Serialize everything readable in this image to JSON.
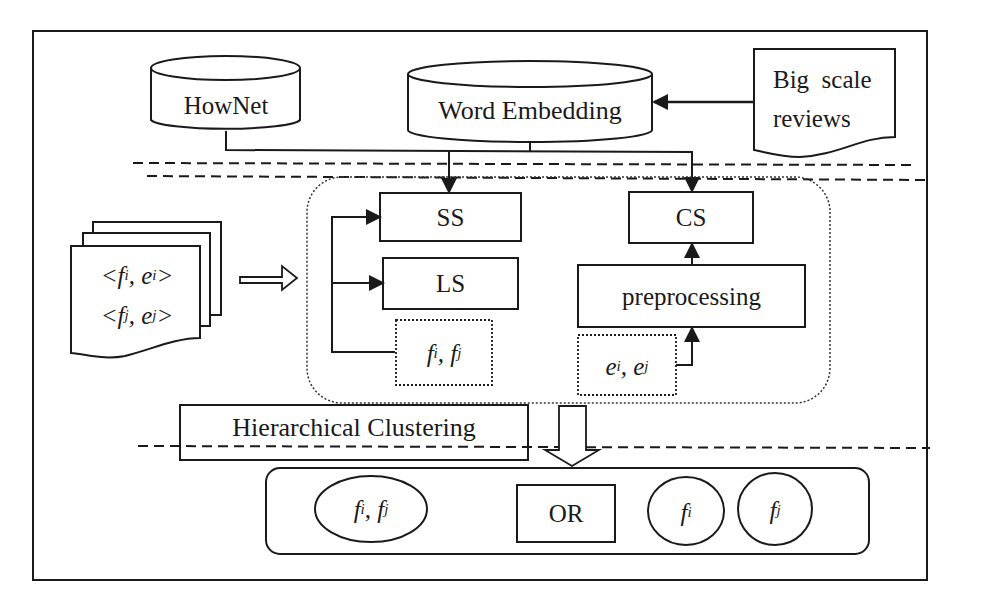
{
  "diagram": {
    "type": "flowchart",
    "sources": {
      "hownet": {
        "label": "HowNet",
        "shape": "cylinder"
      },
      "word_embedding": {
        "label": "Word Embedding",
        "shape": "cylinder"
      },
      "big_scale_reviews": {
        "line1": "Big  scale",
        "line2": "reviews",
        "shape": "document"
      }
    },
    "input_docs": {
      "line1": {
        "open": "<",
        "f": "f",
        "f_sub": "i",
        "sep": ", ",
        "e": "e",
        "e_sub": "i",
        "close": ">"
      },
      "line2": {
        "open": "<",
        "f": "f",
        "f_sub": "j",
        "sep": ", ",
        "e": "e",
        "e_sub": "j",
        "close": ">"
      },
      "shape": "stacked-documents"
    },
    "similarity_modules": {
      "ss": {
        "label": "SS"
      },
      "ls": {
        "label": "LS"
      },
      "features_pair": {
        "a": "f",
        "a_sub": "i",
        "sep": ", ",
        "b": "f",
        "b_sub": "j"
      },
      "cs": {
        "label": "CS"
      },
      "preprocessing": {
        "label": "preprocessing"
      },
      "evaluations_pair": {
        "a": "e",
        "a_sub": "i",
        "sep": ", ",
        "b": "e",
        "b_sub": "j"
      }
    },
    "clustering": {
      "label": "Hierarchical Clustering"
    },
    "output": {
      "merged": {
        "a": "f",
        "a_sub": "i",
        "sep": ", ",
        "b": "f",
        "b_sub": "j"
      },
      "or_label": "OR",
      "single_i": {
        "f": "f",
        "sub": "i"
      },
      "single_j": {
        "f": "f",
        "sub": "j"
      }
    },
    "colors": {
      "stroke": "#1a1a1a",
      "background": "#ffffff"
    }
  }
}
